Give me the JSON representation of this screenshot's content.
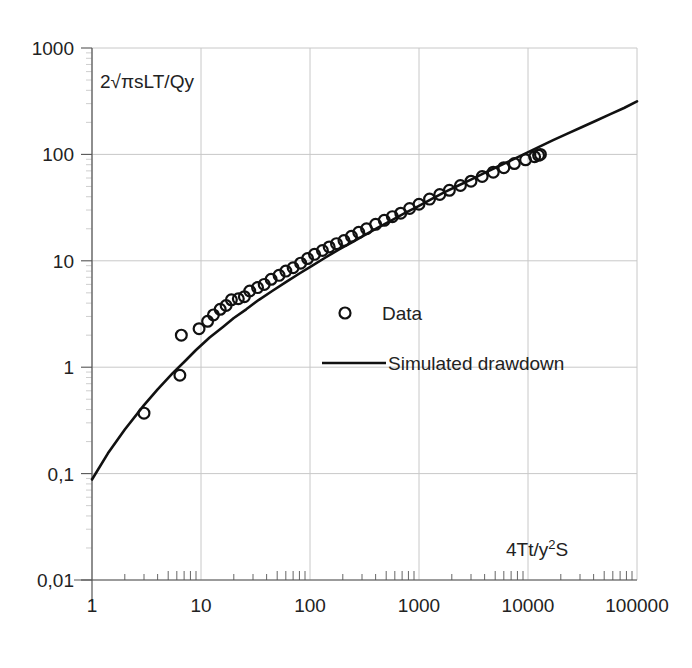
{
  "chart_data": {
    "type": "scatter",
    "title": "",
    "xlabel": "4Tt/y2S",
    "xlabel_parts": {
      "pre": "4Tt/y",
      "sup": "2",
      "post": "S"
    },
    "ylabel": "2√πsLT/Qy",
    "xscale": "log",
    "yscale": "log",
    "xlim": [
      1,
      100000
    ],
    "ylim": [
      0.01,
      1000
    ],
    "xticks": [
      "1",
      "10",
      "100",
      "1000",
      "10000",
      "100000"
    ],
    "xtick_values": [
      1,
      10,
      100,
      1000,
      10000,
      100000
    ],
    "yticks": [
      "0,01",
      "0,1",
      "1",
      "10",
      "100",
      "1000"
    ],
    "ytick_values": [
      0.01,
      0.1,
      1,
      10,
      100,
      1000
    ],
    "grid": true,
    "grid_color": "#c8c8c8",
    "axis_color": "#555555",
    "legend_position": "center-right",
    "series": [
      {
        "name": "Data",
        "type": "scatter",
        "marker": "open-circle",
        "color": "#111111",
        "points": [
          [
            3.0,
            0.37
          ],
          [
            6.4,
            0.84
          ],
          [
            6.6,
            2.0
          ],
          [
            9.6,
            2.3
          ],
          [
            11.5,
            2.7
          ],
          [
            13.0,
            3.1
          ],
          [
            15.0,
            3.5
          ],
          [
            17.0,
            3.8
          ],
          [
            19.0,
            4.3
          ],
          [
            22.0,
            4.4
          ],
          [
            25.0,
            4.6
          ],
          [
            28.0,
            5.2
          ],
          [
            33.0,
            5.6
          ],
          [
            38.0,
            6.0
          ],
          [
            44.0,
            6.7
          ],
          [
            52.0,
            7.3
          ],
          [
            60.0,
            8.0
          ],
          [
            70.0,
            8.6
          ],
          [
            82.0,
            9.5
          ],
          [
            95.0,
            10.5
          ],
          [
            110.0,
            11.5
          ],
          [
            130.0,
            12.5
          ],
          [
            150.0,
            13.5
          ],
          [
            175.0,
            14.5
          ],
          [
            205.0,
            15.5
          ],
          [
            240.0,
            17.0
          ],
          [
            280.0,
            18.5
          ],
          [
            330.0,
            20.0
          ],
          [
            400.0,
            22.0
          ],
          [
            480.0,
            24.0
          ],
          [
            570.0,
            26.0
          ],
          [
            680.0,
            28.0
          ],
          [
            820.0,
            31.0
          ],
          [
            1000.0,
            34.0
          ],
          [
            1250.0,
            38.0
          ],
          [
            1550.0,
            42.0
          ],
          [
            1900.0,
            46.0
          ],
          [
            2400.0,
            51.0
          ],
          [
            3000.0,
            56.0
          ],
          [
            3800.0,
            62.0
          ],
          [
            4800.0,
            68.0
          ],
          [
            6000.0,
            75.0
          ],
          [
            7500.0,
            82.0
          ],
          [
            9500.0,
            89.0
          ],
          [
            11500.0,
            95.0
          ],
          [
            12500.0,
            98.0
          ],
          [
            13000.0,
            100.0
          ]
        ]
      },
      {
        "name": "Simulated drawdown",
        "type": "line",
        "color": "#111111",
        "points": [
          [
            1.0,
            0.088
          ],
          [
            1.4,
            0.155
          ],
          [
            2.0,
            0.26
          ],
          [
            3.0,
            0.44
          ],
          [
            4.0,
            0.62
          ],
          [
            5.5,
            0.88
          ],
          [
            7.0,
            1.12
          ],
          [
            9.0,
            1.45
          ],
          [
            12.0,
            1.9
          ],
          [
            16.0,
            2.4
          ],
          [
            20.0,
            2.9
          ],
          [
            26.0,
            3.5
          ],
          [
            34.0,
            4.3
          ],
          [
            45.0,
            5.2
          ],
          [
            60.0,
            6.3
          ],
          [
            80.0,
            7.6
          ],
          [
            105.0,
            9.0
          ],
          [
            140.0,
            10.8
          ],
          [
            185.0,
            12.8
          ],
          [
            245.0,
            15.0
          ],
          [
            320.0,
            17.5
          ],
          [
            420.0,
            20.5
          ],
          [
            560.0,
            24.0
          ],
          [
            740.0,
            28.0
          ],
          [
            980.0,
            32.5
          ],
          [
            1300.0,
            38.0
          ],
          [
            1700.0,
            44.0
          ],
          [
            2300.0,
            51.0
          ],
          [
            3000.0,
            58.0
          ],
          [
            4000.0,
            67.0
          ],
          [
            5300.0,
            77.0
          ],
          [
            7000.0,
            88.0
          ],
          [
            9300.0,
            101.0
          ],
          [
            12500.0,
            117.0
          ],
          [
            17000.0,
            136.0
          ],
          [
            23000.0,
            157.0
          ],
          [
            31000.0,
            180.0
          ],
          [
            42000.0,
            207.0
          ],
          [
            57000.0,
            239.0
          ],
          [
            76000.0,
            273.0
          ],
          [
            100000.0,
            315.0
          ]
        ]
      }
    ],
    "legend": [
      {
        "label": "Data",
        "marker": "open-circle"
      },
      {
        "label": "Simulated drawdown",
        "marker": "line"
      }
    ]
  }
}
